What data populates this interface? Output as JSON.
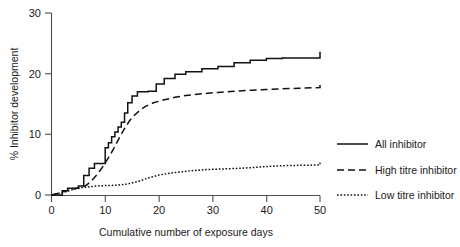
{
  "chart_data": {
    "type": "line",
    "title": "",
    "xlabel": "Cumulative number of exposure days",
    "ylabel": "% Inhibitor development",
    "xlim": [
      0,
      50
    ],
    "ylim": [
      0,
      30
    ],
    "xticks": [
      0,
      10,
      20,
      30,
      40,
      50
    ],
    "yticks": [
      0,
      10,
      20,
      30
    ],
    "grid": false,
    "legend_position": "right",
    "series": [
      {
        "name": "All inhibitor",
        "style": "solid",
        "color": "#111111",
        "step": true,
        "x": [
          0,
          2,
          2,
          3,
          3,
          4,
          4,
          5,
          5,
          6,
          6,
          7,
          7,
          8,
          8,
          9,
          9,
          10,
          10,
          10.6,
          10.6,
          11.2,
          11.2,
          11.8,
          11.8,
          12.4,
          12.4,
          13,
          13,
          13.6,
          13.6,
          14.2,
          14.2,
          15,
          15,
          16,
          16,
          17,
          17,
          18,
          18,
          19.5,
          19.5,
          21,
          21,
          23,
          23,
          25,
          25,
          28,
          28,
          31,
          31,
          34,
          34,
          37,
          37,
          40,
          40,
          43,
          43,
          50,
          50
        ],
        "y": [
          0,
          0,
          0.7,
          0.7,
          1.1,
          1.1,
          1.1,
          1.1,
          1.5,
          1.5,
          3.2,
          3.2,
          4.4,
          4.4,
          5.2,
          5.2,
          5.2,
          5.2,
          7.8,
          7.8,
          8.6,
          8.6,
          9.6,
          9.6,
          10.4,
          10.4,
          11.2,
          11.2,
          12.0,
          12.0,
          13.5,
          13.5,
          15.2,
          15.2,
          16.3,
          16.3,
          17.0,
          17.0,
          17.0,
          17.0,
          17.1,
          17.1,
          18.3,
          18.3,
          19.2,
          19.2,
          19.9,
          19.9,
          20.3,
          20.3,
          20.8,
          20.8,
          21.2,
          21.2,
          21.8,
          21.8,
          22.2,
          22.2,
          22.5,
          22.5,
          22.6,
          22.6,
          23.6
        ]
      },
      {
        "name": "High titre inhibitor",
        "style": "dashed",
        "color": "#111111",
        "step": false,
        "x": [
          0,
          2.5,
          3.5,
          4.5,
          5.5,
          6.5,
          7.5,
          8.5,
          9.5,
          10.5,
          11.5,
          12.5,
          13.5,
          14.5,
          15.5,
          16.5,
          17.5,
          19,
          21,
          23,
          25,
          28,
          31,
          34,
          37,
          40,
          43,
          46,
          50,
          50
        ],
        "y": [
          0,
          0.6,
          0.9,
          1.1,
          1.2,
          1.6,
          2.4,
          3.4,
          4.6,
          6.0,
          7.5,
          9.2,
          10.8,
          12.2,
          13.2,
          14.0,
          14.6,
          15.2,
          15.7,
          16.1,
          16.4,
          16.7,
          16.9,
          17.1,
          17.25,
          17.4,
          17.5,
          17.6,
          17.7,
          18.6
        ]
      },
      {
        "name": "Low titre inhibitor",
        "style": "dotted",
        "color": "#111111",
        "step": false,
        "x": [
          0,
          2.5,
          3.5,
          4.5,
          5.5,
          6.5,
          7.5,
          8.5,
          10,
          12,
          14,
          16,
          18,
          20,
          23,
          26,
          29,
          32,
          35,
          38,
          41,
          44,
          47,
          50,
          50
        ],
        "y": [
          0,
          0.5,
          0.8,
          1.0,
          1.2,
          1.3,
          1.4,
          1.5,
          1.55,
          1.6,
          1.8,
          2.2,
          2.8,
          3.3,
          3.7,
          4.0,
          4.2,
          4.3,
          4.4,
          4.55,
          4.75,
          4.85,
          4.9,
          4.95,
          5.3
        ]
      }
    ]
  },
  "legend": {
    "items": [
      {
        "label": "All inhibitor",
        "style": "solid"
      },
      {
        "label": "High titre inhibitor",
        "style": "dashed"
      },
      {
        "label": "Low titre inhibitor",
        "style": "dotted"
      }
    ]
  },
  "axes": {
    "x_label": "Cumulative number of exposure days",
    "y_label": "% Inhibitor development",
    "x_tick_labels": [
      "0",
      "10",
      "20",
      "30",
      "40",
      "50"
    ],
    "y_tick_labels": [
      "0",
      "10",
      "20",
      "30"
    ]
  }
}
